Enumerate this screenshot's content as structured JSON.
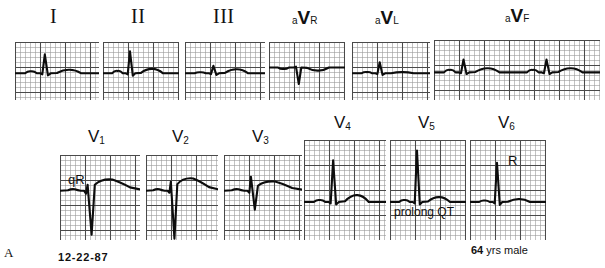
{
  "figure": {
    "panel_letter": "A",
    "date": "12-22-87",
    "demographics_age": "64",
    "demographics_rest": "yrs male",
    "grid_color": "#9a9a9a",
    "grid_bold_color": "#4a4a4a",
    "trace_color": "#0d0d0d",
    "paper_color": "#ffffff"
  },
  "leads": [
    {
      "id": "I",
      "label": "I",
      "label_style": "roman",
      "row": "limb",
      "x": 15,
      "y": 42,
      "w": 84,
      "h": 58,
      "label_x": 50,
      "label_y": 6,
      "beats": 1,
      "annotation": null
    },
    {
      "id": "II",
      "label": "II",
      "label_style": "roman",
      "row": "limb",
      "x": 103,
      "y": 42,
      "w": 76,
      "h": 58,
      "label_x": 131,
      "label_y": 6,
      "beats": 1,
      "annotation": null
    },
    {
      "id": "III",
      "label": "III",
      "label_style": "roman",
      "row": "limb",
      "x": 185,
      "y": 42,
      "w": 80,
      "h": 58,
      "label_x": 213,
      "label_y": 6,
      "beats": 1,
      "annotation": null
    },
    {
      "id": "aVR",
      "label": "aVR",
      "label_prefix": "a",
      "label_v": "V",
      "label_suffix": "R",
      "label_style": "av",
      "row": "limb",
      "x": 269,
      "y": 42,
      "w": 76,
      "h": 58,
      "label_x": 292,
      "label_y": 8,
      "beats": 1,
      "annotation": null
    },
    {
      "id": "aVL",
      "label": "aVL",
      "label_prefix": "a",
      "label_v": "V",
      "label_suffix": "L",
      "label_style": "av",
      "row": "limb",
      "x": 352,
      "y": 42,
      "w": 78,
      "h": 58,
      "label_x": 375,
      "label_y": 8,
      "beats": 1,
      "annotation": null
    },
    {
      "id": "aVF",
      "label": "aVF",
      "label_prefix": "a",
      "label_v": "V",
      "label_suffix": "F",
      "label_style": "av",
      "row": "limb",
      "x": 434,
      "y": 40,
      "w": 166,
      "h": 60,
      "label_x": 505,
      "label_y": 6,
      "beats": 2,
      "annotation": null
    },
    {
      "id": "V1",
      "label": "V1",
      "label_main": "V",
      "label_sub": "1",
      "label_style": "v",
      "row": "chest",
      "x": 60,
      "y": 155,
      "w": 80,
      "h": 85,
      "label_x": 88,
      "label_y": 128,
      "beats": 1,
      "annotation": {
        "text": "qR",
        "x": 8,
        "y": 18
      }
    },
    {
      "id": "V2",
      "label": "V2",
      "label_main": "V",
      "label_sub": "2",
      "label_style": "v",
      "row": "chest",
      "x": 146,
      "y": 155,
      "w": 72,
      "h": 85,
      "label_x": 172,
      "label_y": 128,
      "beats": 1,
      "annotation": null
    },
    {
      "id": "V3",
      "label": "V3",
      "label_main": "V",
      "label_sub": "3",
      "label_style": "v",
      "row": "chest",
      "x": 224,
      "y": 155,
      "w": 78,
      "h": 85,
      "label_x": 252,
      "label_y": 128,
      "beats": 1,
      "annotation": null
    },
    {
      "id": "V4",
      "label": "V4",
      "label_main": "V",
      "label_sub": "4",
      "label_style": "v",
      "row": "chest",
      "x": 304,
      "y": 140,
      "w": 82,
      "h": 100,
      "label_x": 334,
      "label_y": 114,
      "beats": 1,
      "annotation": null
    },
    {
      "id": "V5",
      "label": "V5",
      "label_main": "V",
      "label_sub": "5",
      "label_style": "v",
      "row": "chest",
      "x": 390,
      "y": 140,
      "w": 76,
      "h": 100,
      "label_x": 418,
      "label_y": 114,
      "beats": 1,
      "annotation": {
        "text": "prolong QT",
        "x": 4,
        "y": 66
      }
    },
    {
      "id": "V6",
      "label": "V6",
      "label_main": "V",
      "label_sub": "6",
      "label_style": "v",
      "row": "chest",
      "x": 470,
      "y": 140,
      "w": 76,
      "h": 100,
      "label_x": 498,
      "label_y": 114,
      "beats": 1,
      "annotation": {
        "text": "R",
        "x": 38,
        "y": 14
      }
    }
  ],
  "chart_data": {
    "type": "line",
    "xlabel": "time",
    "ylabel": "voltage",
    "grid_small_mm": 1,
    "grid_large_mm": 5,
    "leads_order": [
      "I",
      "II",
      "III",
      "aVR",
      "aVL",
      "aVF",
      "V1",
      "V2",
      "V3",
      "V4",
      "V5",
      "V6"
    ],
    "annotations": [
      {
        "lead": "V1",
        "text": "qR"
      },
      {
        "lead": "V5",
        "text": "prolong QT"
      },
      {
        "lead": "V6",
        "text": "R"
      }
    ],
    "waveforms": {
      "I": {
        "p": 0.1,
        "q": -0.05,
        "r": 0.95,
        "s": -0.1,
        "t": 0.18,
        "baseline": 0.0
      },
      "II": {
        "p": 0.12,
        "q": -0.05,
        "r": 1.1,
        "s": -0.12,
        "t": 0.22,
        "baseline": 0.0
      },
      "III": {
        "p": 0.05,
        "q": -0.04,
        "r": 0.38,
        "s": -0.08,
        "t": 0.2,
        "baseline": 0.0
      },
      "aVR": {
        "p": -0.08,
        "q": 0.0,
        "r": 0.05,
        "s": -0.95,
        "t": -0.18,
        "baseline": 0.0
      },
      "aVL": {
        "p": 0.06,
        "q": -0.04,
        "r": 0.55,
        "s": -0.08,
        "t": 0.06,
        "baseline": 0.0
      },
      "aVF": {
        "p": 0.12,
        "q": -0.04,
        "r": 0.62,
        "s": -0.08,
        "t": 0.2,
        "baseline": 0.0
      },
      "V1": {
        "p": 0.08,
        "q": -0.15,
        "r": 0.3,
        "s": -2.2,
        "t": 0.55,
        "baseline": 0.0
      },
      "V2": {
        "p": 0.08,
        "q": -0.1,
        "r": 0.45,
        "s": -2.4,
        "t": 0.6,
        "baseline": 0.0
      },
      "V3": {
        "p": 0.08,
        "q": -0.1,
        "r": 0.7,
        "s": -0.95,
        "t": 0.45,
        "baseline": 0.0
      },
      "V4": {
        "p": 0.08,
        "q": -0.06,
        "r": 1.7,
        "s": -0.1,
        "t": 0.28,
        "baseline": 0.0
      },
      "V5": {
        "p": 0.08,
        "q": -0.06,
        "r": 2.1,
        "s": -0.1,
        "t": 0.2,
        "baseline": 0.0
      },
      "V6": {
        "p": 0.06,
        "q": -0.06,
        "r": 1.6,
        "s": -0.12,
        "t": 0.12,
        "baseline": 0.0
      }
    }
  }
}
